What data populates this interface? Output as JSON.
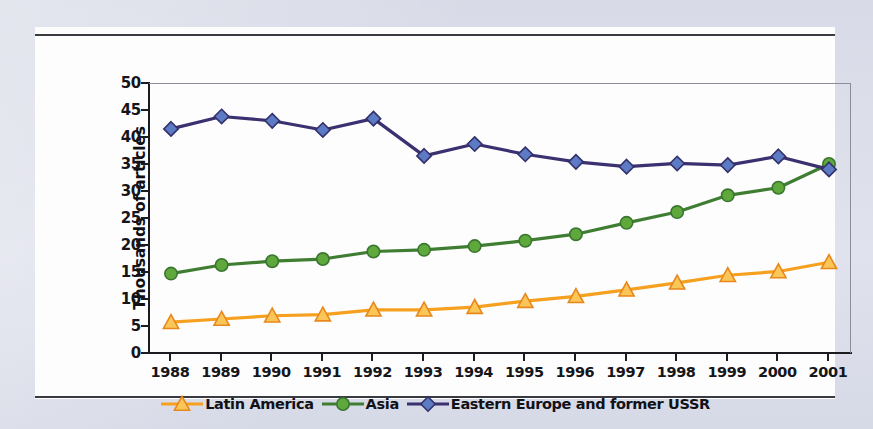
{
  "chart_data": {
    "type": "line",
    "title": "",
    "xlabel": "",
    "ylabel": "Thousands of articles",
    "x": [
      1988,
      1989,
      1990,
      1991,
      1992,
      1993,
      1994,
      1995,
      1996,
      1997,
      1998,
      1999,
      2000,
      2001
    ],
    "xtick_labels": [
      "1988",
      "1989",
      "1990",
      "1991",
      "1992",
      "1993",
      "1994",
      "1995",
      "1996",
      "1997",
      "1998",
      "1999",
      "2000",
      "2001"
    ],
    "ytick_labels": [
      "0",
      "5",
      "10",
      "15",
      "20",
      "25",
      "30",
      "35",
      "40",
      "45",
      "50"
    ],
    "ytick_values": [
      0,
      5,
      10,
      15,
      20,
      25,
      30,
      35,
      40,
      45,
      50
    ],
    "ylim": [
      0,
      50
    ],
    "grid": false,
    "legend_position": "bottom",
    "series": [
      {
        "name": "Latin America",
        "color": "#F5A01E",
        "marker": "triangle",
        "marker_fill": "#FBC658",
        "marker_edge": "#E8871B",
        "values": [
          5.7,
          6.3,
          6.9,
          7.1,
          8.0,
          8.0,
          8.5,
          9.6,
          10.5,
          11.7,
          13.0,
          14.4,
          15.1,
          16.8
        ]
      },
      {
        "name": "Asia",
        "color": "#3F7D33",
        "marker": "circle",
        "marker_fill": "#5EA83C",
        "marker_edge": "#3B7630",
        "values": [
          14.7,
          16.3,
          17.0,
          17.4,
          18.8,
          19.1,
          19.8,
          20.8,
          22.0,
          24.1,
          26.1,
          29.2,
          30.6,
          35.0
        ]
      },
      {
        "name": "Eastern Europe and former USSR",
        "color": "#3B3070",
        "marker": "diamond",
        "marker_fill": "#5C7BC4",
        "marker_edge": "#33306A",
        "values": [
          41.5,
          43.8,
          43.0,
          41.3,
          43.4,
          36.5,
          38.7,
          36.8,
          35.4,
          34.5,
          35.1,
          34.8,
          36.4,
          34.0
        ]
      }
    ]
  }
}
